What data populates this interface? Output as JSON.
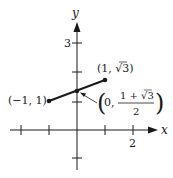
{
  "diagram": {
    "axes": {
      "x_label": "x",
      "y_label": "y",
      "x_tick_label": "2",
      "y_tick_label": "3",
      "x_ticks": [
        -2,
        -1,
        1,
        2
      ],
      "y_ticks": [
        -1,
        1,
        2,
        3
      ]
    },
    "points": [
      {
        "name": "left-endpoint",
        "label": "(−1, 1)",
        "x": -1,
        "y": 1
      },
      {
        "name": "right-endpoint",
        "label_open": "(1, ",
        "label_rad": "√3",
        "label_close": ")",
        "x": 1,
        "y": 1.732
      },
      {
        "name": "midpoint",
        "label_open": "(0,",
        "numerator": "1 + √3",
        "denominator": "2",
        "label_close": ")",
        "x": 0,
        "y": 1.366
      }
    ],
    "segment": {
      "from": [
        -1,
        1
      ],
      "to": [
        1,
        1.732
      ]
    },
    "colors": {
      "ink": "#1a1a1a",
      "background": "#ffffff"
    }
  }
}
